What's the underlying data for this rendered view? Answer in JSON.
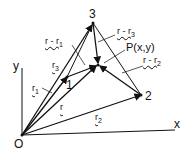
{
  "diagram": {
    "type": "vector-triangle",
    "points": {
      "origin": {
        "label": "O",
        "x": 22,
        "y": 135
      },
      "p1": {
        "label": "1",
        "x": 67,
        "y": 77
      },
      "p2": {
        "label": "2",
        "x": 141,
        "y": 95
      },
      "p3": {
        "label": "3",
        "x": 93,
        "y": 23
      },
      "P": {
        "label": "P(x,y)",
        "x": 98,
        "y": 65
      }
    },
    "axes": {
      "x_label": "x",
      "y_label": "y"
    },
    "vector_labels": {
      "r": "r",
      "r1": "r",
      "r1_sub": "1",
      "r2": "r",
      "r2_sub": "2",
      "r3": "r",
      "r3_sub": "3",
      "r_minus_r1": "r - r",
      "r_minus_r1_sub": "1",
      "r_minus_r2": "r - r",
      "r_minus_r2_sub": "2",
      "r_minus_r3": "r - r",
      "r_minus_r3_sub": "3"
    },
    "colors": {
      "ink": "#111111",
      "background": "#ffffff"
    }
  }
}
